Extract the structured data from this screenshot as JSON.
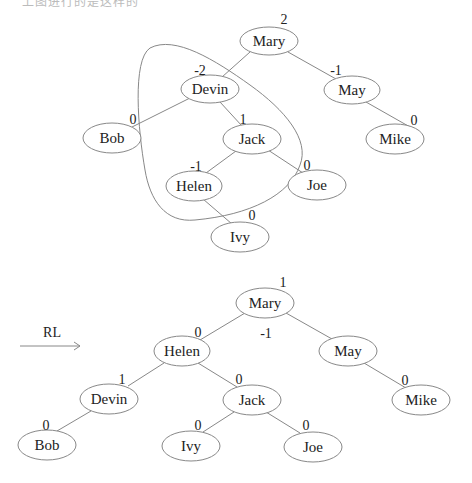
{
  "caption": "上图进行的是这样的",
  "rotation": {
    "label": "RL"
  },
  "trees": {
    "before": {
      "nodes": {
        "mary": {
          "name": "Mary",
          "bf": "2"
        },
        "devin": {
          "name": "Devin",
          "bf": "-2"
        },
        "may": {
          "name": "May",
          "bf": "-1"
        },
        "bob": {
          "name": "Bob",
          "bf": "0"
        },
        "jack": {
          "name": "Jack",
          "bf": "1"
        },
        "mike": {
          "name": "Mike",
          "bf": "0"
        },
        "helen": {
          "name": "Helen",
          "bf": "-1"
        },
        "joe": {
          "name": "Joe",
          "bf": "0"
        },
        "ivy": {
          "name": "Ivy",
          "bf": "0"
        }
      },
      "edges": [
        [
          "Mary",
          "Devin"
        ],
        [
          "Mary",
          "May"
        ],
        [
          "Devin",
          "Bob"
        ],
        [
          "Devin",
          "Jack"
        ],
        [
          "May",
          "Mike"
        ],
        [
          "Jack",
          "Helen"
        ],
        [
          "Jack",
          "Joe"
        ],
        [
          "Helen",
          "Ivy"
        ]
      ]
    },
    "after": {
      "nodes": {
        "mary": {
          "name": "Mary",
          "bf": "1"
        },
        "helen": {
          "name": "Helen",
          "bf": "0"
        },
        "may": {
          "name": "May",
          "bf": "-1"
        },
        "devin": {
          "name": "Devin",
          "bf": "1"
        },
        "jack": {
          "name": "Jack",
          "bf": "0"
        },
        "mike": {
          "name": "Mike",
          "bf": "0"
        },
        "bob": {
          "name": "Bob",
          "bf": "0"
        },
        "ivy": {
          "name": "Ivy",
          "bf": "0"
        },
        "joe": {
          "name": "Joe",
          "bf": "0"
        }
      },
      "edges": [
        [
          "Mary",
          "Helen"
        ],
        [
          "Mary",
          "May"
        ],
        [
          "Helen",
          "Devin"
        ],
        [
          "Helen",
          "Jack"
        ],
        [
          "May",
          "Mike"
        ],
        [
          "Devin",
          "Bob"
        ],
        [
          "Jack",
          "Ivy"
        ],
        [
          "Jack",
          "Joe"
        ]
      ]
    }
  }
}
